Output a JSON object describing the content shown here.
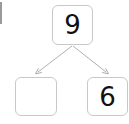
{
  "number_bond": {
    "whole": "9",
    "parts": [
      "",
      "6"
    ]
  },
  "colors": {
    "box_border": "#c8c8c8",
    "arrow": "#b0b0b0",
    "text": "#111111"
  }
}
